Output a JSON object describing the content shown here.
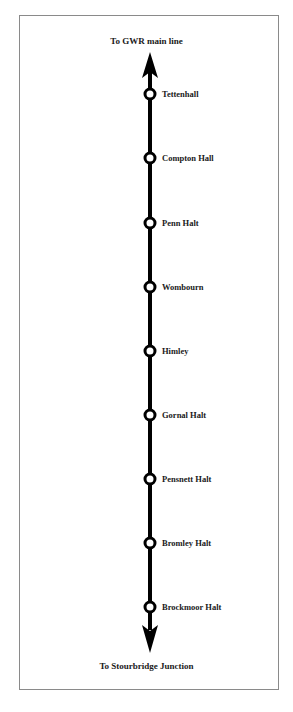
{
  "diagram": {
    "title_top": "To GWR main line",
    "title_bottom": "To Stourbridge Junction",
    "line_color": "#000000",
    "stations": [
      {
        "name": "Tettenhall",
        "y": 94
      },
      {
        "name": "Compton Hall",
        "y": 158
      },
      {
        "name": "Penn Halt",
        "y": 223
      },
      {
        "name": "Wombourn",
        "y": 287
      },
      {
        "name": "Himley",
        "y": 351
      },
      {
        "name": "Gornal Halt",
        "y": 415
      },
      {
        "name": "Pensnett Halt",
        "y": 479
      },
      {
        "name": "Bromley Halt",
        "y": 543
      },
      {
        "name": "Brockmoor Halt",
        "y": 607
      }
    ]
  }
}
